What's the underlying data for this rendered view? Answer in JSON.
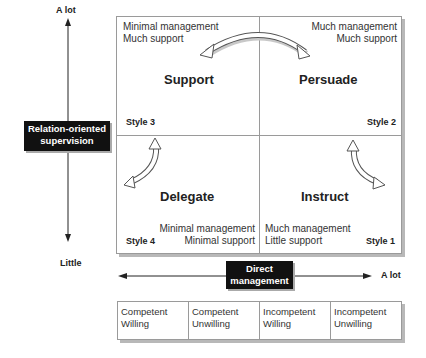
{
  "vertical_axis": {
    "top_label": "A lot",
    "bottom_label": "Little",
    "title_line1": "Relation-oriented",
    "title_line2": "supervision"
  },
  "horizontal_axis": {
    "right_label": "A lot",
    "title_line1": "Direct",
    "title_line2": "management"
  },
  "quadrants": {
    "support": {
      "title": "Support",
      "style": "Style 3",
      "desc_line1": "Minimal management",
      "desc_line2": "Much support"
    },
    "persuade": {
      "title": "Persuade",
      "style": "Style 2",
      "desc_line1": "Much management",
      "desc_line2": "Much support"
    },
    "delegate": {
      "title": "Delegate",
      "style": "Style 4",
      "desc_line1": "Minimal management",
      "desc_line2": "Minimal support"
    },
    "instruct": {
      "title": "Instruct",
      "style": "Style 1",
      "desc_line1": "Much management",
      "desc_line2": "Little support"
    }
  },
  "employee_types": [
    {
      "line1": "Competent",
      "line2": "Willing"
    },
    {
      "line1": "Competent",
      "line2": "Unwilling"
    },
    {
      "line1": "Incompetent",
      "line2": "Willing"
    },
    {
      "line1": "Incompetent",
      "line2": "Unwilling"
    }
  ]
}
